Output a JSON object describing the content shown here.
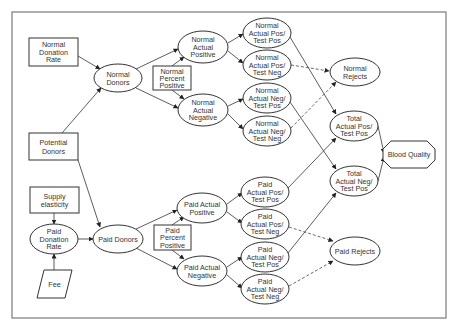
{
  "diagram": {
    "nodes": {
      "normal_donation_rate": {
        "shape": "rectangle",
        "lines": [
          "Normal",
          "Donation",
          "Rate"
        ]
      },
      "potential_donors": {
        "shape": "rectangle",
        "lines": [
          "Potential",
          "Donors"
        ]
      },
      "supply_elasticity": {
        "shape": "rectangle",
        "lines": [
          "Supply",
          "elasticity"
        ]
      },
      "paid_donation_rate": {
        "shape": "ellipse",
        "lines": [
          "Paid",
          "Donation",
          "Rate"
        ]
      },
      "fee": {
        "shape": "parallelogram",
        "lines": [
          "Fee"
        ]
      },
      "normal_donors": {
        "shape": "ellipse",
        "lines": [
          "Normal",
          "Donors"
        ]
      },
      "paid_donors": {
        "shape": "ellipse",
        "lines": [
          "Paid Donors"
        ]
      },
      "normal_percent_positive": {
        "shape": "rectangle",
        "lines": [
          "Normal",
          "Percent",
          "Positive"
        ]
      },
      "paid_percent_positive": {
        "shape": "rectangle",
        "lines": [
          "Paid",
          "Percent",
          "Positive"
        ]
      },
      "normal_actual_positive": {
        "shape": "ellipse",
        "lines": [
          "Normal",
          "Actual",
          "Positive"
        ]
      },
      "normal_actual_negative": {
        "shape": "ellipse",
        "lines": [
          "Normal",
          "Actual",
          "Negative"
        ]
      },
      "paid_actual_positive": {
        "shape": "ellipse",
        "lines": [
          "Paid Actual",
          "Positive"
        ]
      },
      "paid_actual_negative": {
        "shape": "ellipse",
        "lines": [
          "Paid Actual",
          "Negative"
        ]
      },
      "normal_pos_testpos": {
        "shape": "ellipse",
        "lines": [
          "Normal",
          "Actual Pos/",
          "Test Pos"
        ]
      },
      "normal_pos_testneg": {
        "shape": "ellipse",
        "lines": [
          "Normal",
          "Actual Pos/",
          "Test Neg"
        ]
      },
      "normal_neg_testpos": {
        "shape": "ellipse",
        "lines": [
          "Normal",
          "Actual Neg/",
          "Test Pos"
        ]
      },
      "normal_neg_testneg": {
        "shape": "ellipse",
        "lines": [
          "Normal",
          "Actual Neg/",
          "Test Neg"
        ]
      },
      "paid_pos_testpos": {
        "shape": "ellipse",
        "lines": [
          "Paid",
          "Actual Pos/",
          "Test Pos"
        ]
      },
      "paid_pos_testneg": {
        "shape": "ellipse",
        "lines": [
          "Paid",
          "Actual Pos/",
          "Test Neg"
        ]
      },
      "paid_neg_testpos": {
        "shape": "ellipse",
        "lines": [
          "Paid",
          "Actual Neg/",
          "Test Pos"
        ]
      },
      "paid_neg_testneg": {
        "shape": "ellipse",
        "lines": [
          "Paid",
          "Actual Neg/",
          "Test Neg"
        ]
      },
      "normal_rejects": {
        "shape": "ellipse",
        "lines": [
          "Normal",
          "Rejects"
        ]
      },
      "paid_rejects": {
        "shape": "ellipse",
        "lines": [
          "Paid Rejects"
        ]
      },
      "total_pos_testpos": {
        "shape": "ellipse",
        "lines": [
          "Total",
          "Actual Pos/",
          "Test Pos"
        ]
      },
      "total_neg_testpos": {
        "shape": "ellipse",
        "lines": [
          "Total",
          "Actual Neg/",
          "Test Pos"
        ]
      },
      "blood_quality": {
        "shape": "octagon",
        "lines": [
          "Blood Quality"
        ]
      }
    },
    "edges": [
      {
        "from": "normal_donation_rate",
        "to": "normal_donors",
        "style": "solid"
      },
      {
        "from": "potential_donors",
        "to": "normal_donors",
        "style": "solid"
      },
      {
        "from": "potential_donors",
        "to": "paid_donors",
        "style": "solid"
      },
      {
        "from": "supply_elasticity",
        "to": "paid_donation_rate",
        "style": "solid"
      },
      {
        "from": "fee",
        "to": "paid_donation_rate",
        "style": "solid"
      },
      {
        "from": "paid_donation_rate",
        "to": "paid_donors",
        "style": "solid"
      },
      {
        "from": "normal_donors",
        "to": "normal_actual_positive",
        "style": "solid"
      },
      {
        "from": "normal_donors",
        "to": "normal_actual_negative",
        "style": "solid"
      },
      {
        "from": "normal_percent_positive",
        "to": "normal_actual_positive",
        "style": "solid"
      },
      {
        "from": "normal_percent_positive",
        "to": "normal_actual_negative",
        "style": "solid"
      },
      {
        "from": "paid_donors",
        "to": "paid_actual_positive",
        "style": "solid"
      },
      {
        "from": "paid_donors",
        "to": "paid_actual_negative",
        "style": "solid"
      },
      {
        "from": "paid_percent_positive",
        "to": "paid_actual_positive",
        "style": "solid"
      },
      {
        "from": "paid_percent_positive",
        "to": "paid_actual_negative",
        "style": "solid"
      },
      {
        "from": "normal_actual_positive",
        "to": "normal_pos_testpos",
        "style": "solid"
      },
      {
        "from": "normal_actual_positive",
        "to": "normal_pos_testneg",
        "style": "solid"
      },
      {
        "from": "normal_actual_negative",
        "to": "normal_neg_testpos",
        "style": "solid"
      },
      {
        "from": "normal_actual_negative",
        "to": "normal_neg_testneg",
        "style": "solid"
      },
      {
        "from": "paid_actual_positive",
        "to": "paid_pos_testpos",
        "style": "solid"
      },
      {
        "from": "paid_actual_positive",
        "to": "paid_pos_testneg",
        "style": "solid"
      },
      {
        "from": "paid_actual_negative",
        "to": "paid_neg_testpos",
        "style": "solid"
      },
      {
        "from": "paid_actual_negative",
        "to": "paid_neg_testneg",
        "style": "solid"
      },
      {
        "from": "normal_pos_testneg",
        "to": "normal_rejects",
        "style": "dashed"
      },
      {
        "from": "normal_neg_testneg",
        "to": "normal_rejects",
        "style": "dashed"
      },
      {
        "from": "paid_pos_testneg",
        "to": "paid_rejects",
        "style": "dashed"
      },
      {
        "from": "paid_neg_testneg",
        "to": "paid_rejects",
        "style": "dashed"
      },
      {
        "from": "normal_pos_testpos",
        "to": "total_pos_testpos",
        "style": "solid"
      },
      {
        "from": "paid_pos_testpos",
        "to": "total_pos_testpos",
        "style": "solid"
      },
      {
        "from": "normal_neg_testpos",
        "to": "total_neg_testpos",
        "style": "solid"
      },
      {
        "from": "paid_neg_testpos",
        "to": "total_neg_testpos",
        "style": "solid"
      },
      {
        "from": "total_pos_testpos",
        "to": "blood_quality",
        "style": "solid"
      },
      {
        "from": "total_neg_testpos",
        "to": "blood_quality",
        "style": "solid"
      }
    ]
  }
}
